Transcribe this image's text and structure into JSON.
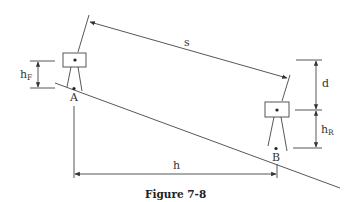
{
  "figure": {
    "caption": "Figure 7-8",
    "labels": {
      "slope_distance": "s",
      "horizontal_distance": "h",
      "difference": "d",
      "point_a": "A",
      "point_b": "B",
      "h_f_main": "h",
      "h_f_sub": "F",
      "h_r_main": "h",
      "h_r_sub": "R"
    },
    "colors": {
      "line": "#444444",
      "text": "#333333",
      "background": "#ffffff"
    }
  }
}
